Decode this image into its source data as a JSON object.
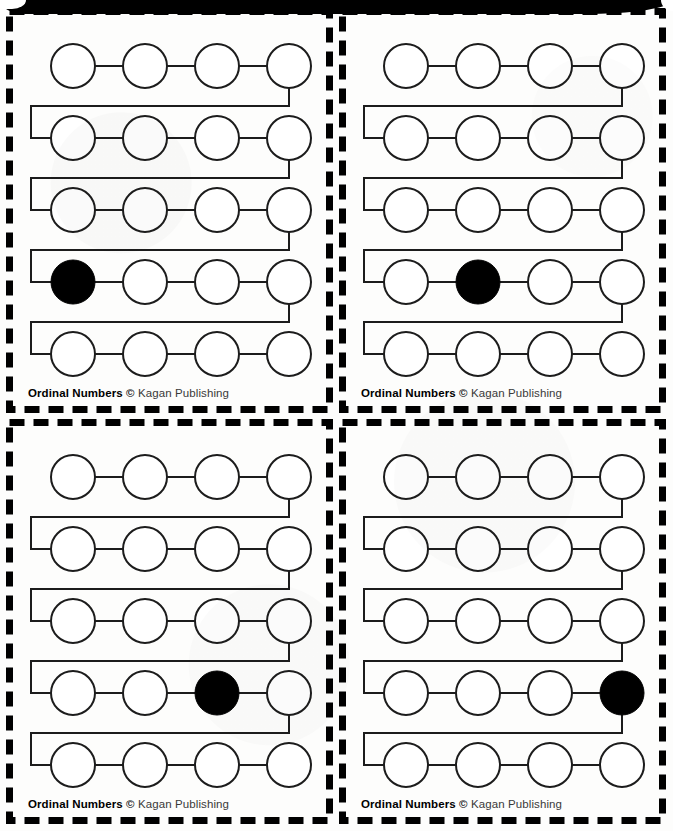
{
  "document": {
    "title": "Ordinal Numbers",
    "publisher": "Kagan Publishing",
    "copyright_symbol": "©",
    "footer_text": "Ordinal Numbers © Kagan Publishing",
    "page_background": "#fdfdfc",
    "ink_color": "#1a1a1a",
    "fill_color": "#000000"
  },
  "layout": {
    "grid_rows": 2,
    "grid_columns": 2,
    "card_count": 4,
    "cut_line_style": "dashed",
    "cut_line_color": "#000000"
  },
  "chart_data": {
    "type": "diagram",
    "rows_per_card": 5,
    "circles_per_row": 4,
    "circles_per_card": 20,
    "circle_diameter_px": 44,
    "circle_spacing_px": 72,
    "cards": [
      {
        "id": "top-left",
        "position": "top-left",
        "filled_row": 4,
        "filled_column": 1,
        "filled_ordinal_index": 13,
        "filled_ordinal_name": "thirteenth",
        "footer": "Ordinal Numbers © Kagan Publishing"
      },
      {
        "id": "top-right",
        "position": "top-right",
        "filled_row": 4,
        "filled_column": 2,
        "filled_ordinal_index": 14,
        "filled_ordinal_name": "fourteenth",
        "footer": "Ordinal Numbers © Kagan Publishing"
      },
      {
        "id": "bottom-left",
        "position": "bottom-left",
        "filled_row": 4,
        "filled_column": 3,
        "filled_ordinal_index": 15,
        "filled_ordinal_name": "fifteenth",
        "footer": "Ordinal Numbers © Kagan Publishing"
      },
      {
        "id": "bottom-right",
        "position": "bottom-right",
        "filled_row": 4,
        "filled_column": 4,
        "filled_ordinal_index": 16,
        "filled_ordinal_name": "sixteenth",
        "footer": "Ordinal Numbers © Kagan Publishing"
      }
    ]
  },
  "footer": {
    "title": "Ordinal Numbers",
    "space": " ",
    "copyright": "©",
    "publisher": " Kagan Publishing"
  }
}
